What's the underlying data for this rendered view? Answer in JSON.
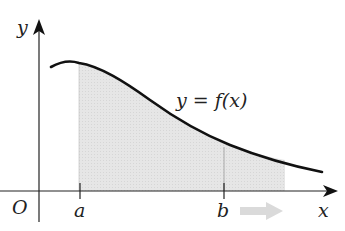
{
  "diagram": {
    "type": "definite-integral-area",
    "axes": {
      "x_label": "x",
      "y_label": "y",
      "origin_label": "O"
    },
    "curve": {
      "label": "y = f(x)",
      "label_parts": {
        "lhs": "y",
        "eq": " = ",
        "rhs": "f(x)"
      }
    },
    "bounds": {
      "lower_label": "a",
      "upper_label": "b"
    },
    "shaded_region": {
      "from": "a",
      "to": "beyond b",
      "note": "arrow indicates upper bound moving right"
    },
    "colors": {
      "axis": "#222222",
      "curve": "#111111",
      "shading": "#e4e4e4",
      "arrow": "#d9d9d9"
    }
  }
}
